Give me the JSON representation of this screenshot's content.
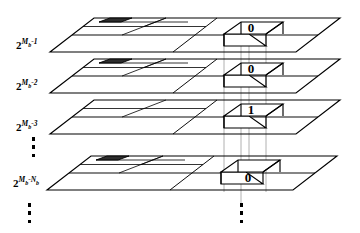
{
  "figure": {
    "colors": {
      "line": "#000000",
      "guide": "#9a9a9a",
      "shaded_cell": "#2b2b2b",
      "background": "#ffffff"
    },
    "plane_count": 4,
    "planes": [
      {
        "id": "plane-1",
        "label_base": "2",
        "label_exponent": "M",
        "label_exponent_sub": "b",
        "label_exponent_tail": "-1",
        "label_plain": "2^(Mb-1)",
        "bit": "0",
        "has_shaded_cell": true
      },
      {
        "id": "plane-2",
        "label_base": "2",
        "label_exponent": "M",
        "label_exponent_sub": "b",
        "label_exponent_tail": "-2",
        "label_plain": "2^(Mb-2)",
        "bit": "0",
        "has_shaded_cell": true
      },
      {
        "id": "plane-3",
        "label_base": "2",
        "label_exponent": "M",
        "label_exponent_sub": "b",
        "label_exponent_tail": "-3",
        "label_plain": "2^(Mb-3)",
        "bit": "1",
        "has_shaded_cell": false
      },
      {
        "id": "plane-n",
        "label_base": "2",
        "label_exponent": "M",
        "label_exponent_sub": "b",
        "label_exponent_tail": "-N",
        "label_exponent_tail_sub": "b",
        "label_plain": "2^(Mb-Nb)",
        "bit": "0",
        "has_shaded_cell": true
      }
    ],
    "bit_column": {
      "name": "bit-column",
      "values": [
        "0",
        "0",
        "1",
        "0"
      ],
      "description": "vertical column of bit cells through the plane stack"
    },
    "ellipses": [
      {
        "id": "ellipsis-left-middle",
        "dots": 3
      },
      {
        "id": "ellipsis-left-bottom",
        "dots": 3
      },
      {
        "id": "ellipsis-right-bottom",
        "dots": 3
      }
    ]
  }
}
